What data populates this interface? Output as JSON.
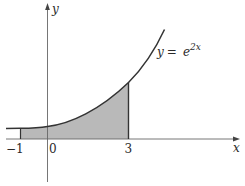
{
  "figure": {
    "type": "function-plot",
    "function_label": {
      "lhs": "y",
      "eq": " = ",
      "base": "e",
      "exponent": "2x"
    },
    "axes": {
      "x_label": "x",
      "y_label": "y",
      "ticks": [
        "−1",
        "0",
        "3"
      ]
    },
    "shaded_region": {
      "from": "−1",
      "to": "3",
      "fill": "#b8b8b8"
    },
    "colors": {
      "curve": "#3a3a3a",
      "axis": "#555555",
      "shade": "#b8b8b8"
    }
  }
}
